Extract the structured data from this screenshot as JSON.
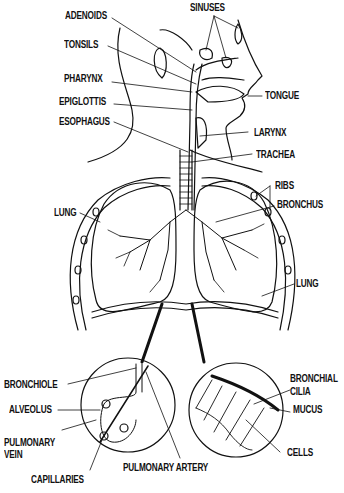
{
  "diagram": {
    "type": "anatomy",
    "labels": {
      "adenoids": "ADENOIDS",
      "tonsils": "TONSILS",
      "pharynx": "PHARYNX",
      "epiglottis": "EPIGLOTTIS",
      "esophagus": "ESOPHAGUS",
      "sinuses": "SINUSES",
      "tongue": "TONGUE",
      "larynx": "LARYNX",
      "trachea": "TRACHEA",
      "ribs": "RIBS",
      "bronchus": "BRONCHUS",
      "lung_left": "LUNG",
      "lung_right": "LUNG",
      "bronchiole": "BRONCHIOLE",
      "alveolus": "ALVEOLUS",
      "pulmonary_vein_1": "PULMONARY",
      "pulmonary_vein_2": "VEIN",
      "capillaries": "CAPILLARIES",
      "pulmonary_artery": "PULMONARY ARTERY",
      "bronchial_1": "BRONCHIAL",
      "cilia": "CILIA",
      "mucus": "MUCUS",
      "cells": "CELLS"
    },
    "colors": {
      "ink": "#111111",
      "background": "#ffffff"
    }
  }
}
